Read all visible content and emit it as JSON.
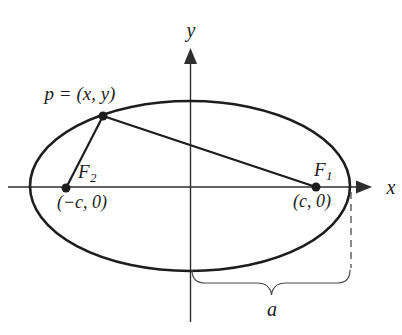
{
  "colors": {
    "background": "#ffffff",
    "ink": "#1d1d1d",
    "axis": "#2e2e2e",
    "annotation": "#4a4a4a"
  },
  "axes": {
    "x_label": "x",
    "y_label": "y"
  },
  "ellipse": {
    "point_label": "p = (x, y)",
    "focus_left": {
      "name": "F",
      "subscript": "2",
      "coordinates": "(−c, 0)"
    },
    "focus_right": {
      "name": "F",
      "subscript": "1",
      "coordinates": "(c, 0)"
    },
    "semi_major_axis_label": "a"
  }
}
